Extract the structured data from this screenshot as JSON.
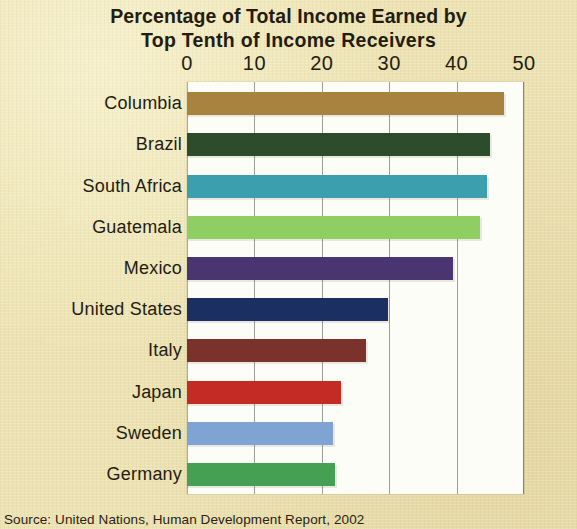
{
  "figure": {
    "background_color": "#ece2b2",
    "plot_background_color": "#fdfdf8",
    "text_color": "#241c10",
    "gridline_color": "#8d8d87"
  },
  "title": {
    "line1": "Percentage of Total Income Earned by",
    "line2": "Top Tenth of Income Receivers"
  },
  "source": {
    "text": "Source: United Nations, Human Development Report, 2002"
  },
  "chart_data": {
    "type": "bar",
    "orientation": "horizontal",
    "title": "Percentage of Total Income Earned by Top Tenth of Income Receivers",
    "xlabel": "",
    "ylabel": "",
    "xlim": [
      0,
      50
    ],
    "xticks": [
      0,
      10,
      20,
      30,
      40,
      50
    ],
    "xticklabels": [
      "0",
      "10",
      "20",
      "30",
      "40",
      "50"
    ],
    "grid": "vertical",
    "legend": "none",
    "categories": [
      "Columbia",
      "Brazil",
      "South Africa",
      "Guatemala",
      "Mexico",
      "United States",
      "Italy",
      "Japan",
      "Sweden",
      "Germany"
    ],
    "values": [
      47.1,
      45.0,
      44.5,
      43.4,
      39.4,
      29.8,
      26.6,
      22.8,
      21.7,
      22.0
    ],
    "colors": [
      "#a8833f",
      "#2c4c2b",
      "#3c9fae",
      "#8fce62",
      "#4a3570",
      "#1b2f63",
      "#7c322c",
      "#c42b24",
      "#7fa4d4",
      "#46a053"
    ],
    "bars": [
      {
        "label": "Columbia",
        "value": 47.1,
        "color": "#a8833f"
      },
      {
        "label": "Brazil",
        "value": 45.0,
        "color": "#2c4c2b"
      },
      {
        "label": "South Africa",
        "value": 44.5,
        "color": "#3c9fae"
      },
      {
        "label": "Guatemala",
        "value": 43.4,
        "color": "#8fce62"
      },
      {
        "label": "Mexico",
        "value": 39.4,
        "color": "#4a3570"
      },
      {
        "label": "United States",
        "value": 29.8,
        "color": "#1b2f63"
      },
      {
        "label": "Italy",
        "value": 26.6,
        "color": "#7c322c"
      },
      {
        "label": "Japan",
        "value": 22.8,
        "color": "#c42b24"
      },
      {
        "label": "Sweden",
        "value": 21.7,
        "color": "#7fa4d4"
      },
      {
        "label": "Germany",
        "value": 22.0,
        "color": "#46a053"
      }
    ]
  }
}
